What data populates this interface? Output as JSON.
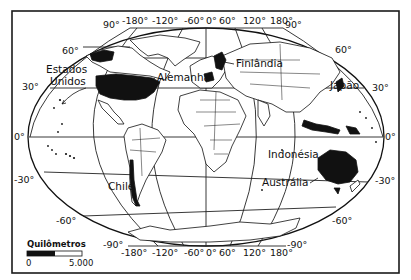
{
  "map": {
    "projection_style": "elliptical world map with graticule",
    "colors": {
      "background": "#ffffff",
      "ink": "#111111",
      "highlight": "#111111"
    },
    "countries": [
      {
        "name": "Estados Unidos",
        "highlighted": true
      },
      {
        "name": "Alemanha",
        "highlighted": true
      },
      {
        "name": "Finlândia",
        "highlighted": true
      },
      {
        "name": "Japão",
        "highlighted": true
      },
      {
        "name": "Indonésia",
        "highlighted": true
      },
      {
        "name": "Austrália",
        "highlighted": true
      },
      {
        "name": "Chile",
        "highlighted": true
      }
    ],
    "labels": {
      "usa": "Estados",
      "usa2": "Unidos",
      "germany": "Alemanha",
      "finland": "Finlândia",
      "japan": "Japão",
      "indonesia": "Indonésia",
      "australia": "Austrália",
      "chile": "Chile"
    },
    "top_longitudes": [
      "90°",
      "-180°",
      "-120°",
      "-60°",
      "0°",
      "60°",
      "120°",
      "180°",
      "90°"
    ],
    "bottom_longitudes": [
      "-90°",
      "-180°",
      "-120°",
      "-60°",
      "0°",
      "60°",
      "120°",
      "180°",
      "-90°"
    ],
    "left_latitudes": [
      "60°",
      "30°",
      "0°",
      "-30°",
      "-60°"
    ],
    "right_latitudes": [
      "60°",
      "30°",
      "0°",
      "-30°",
      "-60°"
    ],
    "scale": {
      "title": "Quilômetros",
      "min": "0",
      "max": "5.000"
    }
  }
}
